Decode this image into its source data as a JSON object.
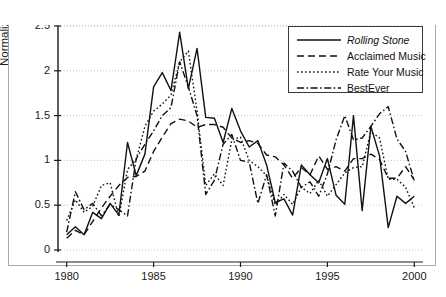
{
  "figure": {
    "background": "#ffffff",
    "border_color": "#aaaaaa",
    "axis_color": "#1a1a1a",
    "grid_color": "#bbbbbb"
  },
  "axes": {
    "ylabel": "Normalized index",
    "yticks": [
      "0",
      "0.5",
      "1",
      "1.5",
      "2",
      "2.5"
    ],
    "xticks": [
      "1980",
      "1985",
      "1990",
      "1995",
      "2000"
    ]
  },
  "legend": {
    "items": [
      {
        "label": "Rolling Stone",
        "style": "solid",
        "italic": true
      },
      {
        "label": "Acclaimed Music",
        "style": "dashed",
        "italic": false
      },
      {
        "label": "Rate Your Music",
        "style": "dotted",
        "italic": false
      },
      {
        "label": "BestEver",
        "style": "dashdot",
        "italic": false
      }
    ]
  },
  "chart_data": {
    "type": "line",
    "title": "",
    "xlabel": "",
    "ylabel": "Normalized index",
    "xlim": [
      1979.5,
      2000.5
    ],
    "ylim": [
      0,
      2.5
    ],
    "xticks": [
      1980,
      1985,
      1990,
      1995,
      2000
    ],
    "yticks": [
      0,
      0.5,
      1,
      1.5,
      2,
      2.5
    ],
    "grid": "horizontal-dotted",
    "legend_position": "top-right",
    "x": [
      1980,
      1980.5,
      1981,
      1981.5,
      1982,
      1982.5,
      1983,
      1983.5,
      1984,
      1984.5,
      1985,
      1985.5,
      1986,
      1986.5,
      1987,
      1987.5,
      1988,
      1988.5,
      1989,
      1989.5,
      1990,
      1990.5,
      1991,
      1991.5,
      1992,
      1992.5,
      1993,
      1993.5,
      1994,
      1994.5,
      1995,
      1995.5,
      1996,
      1996.5,
      1997,
      1997.5,
      1998,
      1998.5,
      1999,
      1999.5,
      2000
    ],
    "series": [
      {
        "name": "Rolling Stone",
        "style": "solid",
        "values": [
          0.17,
          0.26,
          0.17,
          0.42,
          0.35,
          0.52,
          0.39,
          1.2,
          0.83,
          1.07,
          1.82,
          1.98,
          1.78,
          2.43,
          1.8,
          2.25,
          1.48,
          1.47,
          1.2,
          1.58,
          1.33,
          1.15,
          1.22,
          0.95,
          0.53,
          0.57,
          0.39,
          0.95,
          0.84,
          0.75,
          1.02,
          0.61,
          0.51,
          1.5,
          0.44,
          1.38,
          1.05,
          0.25,
          0.6,
          0.52,
          0.6
        ]
      },
      {
        "name": "Acclaimed Music",
        "style": "dashed",
        "values": [
          0.13,
          0.22,
          0.17,
          0.32,
          0.47,
          0.6,
          0.72,
          0.81,
          0.82,
          0.88,
          1.1,
          1.26,
          1.41,
          1.46,
          1.44,
          1.37,
          1.4,
          1.4,
          1.37,
          1.25,
          1.2,
          1.22,
          1.19,
          1.06,
          1.04,
          0.95,
          0.8,
          0.92,
          0.84,
          1.05,
          0.9,
          0.93,
          0.88,
          1.02,
          1.02,
          1.07,
          1.01,
          0.8,
          0.8,
          0.93,
          0.78
        ]
      },
      {
        "name": "Rate Your Music",
        "style": "dotted",
        "values": [
          0.33,
          0.56,
          0.42,
          0.49,
          0.72,
          0.75,
          0.37,
          0.9,
          1.01,
          1.38,
          1.55,
          1.63,
          1.73,
          2.1,
          2.22,
          1.55,
          0.72,
          0.85,
          0.72,
          1.23,
          1.26,
          1.0,
          0.93,
          0.83,
          0.5,
          0.62,
          0.51,
          0.7,
          0.63,
          0.78,
          0.6,
          0.73,
          0.86,
          0.92,
          0.93,
          1.32,
          1.25,
          0.79,
          0.79,
          0.7,
          0.47
        ]
      },
      {
        "name": "BestEver",
        "style": "dashdot",
        "values": [
          0.2,
          0.65,
          0.45,
          0.52,
          0.38,
          0.51,
          0.45,
          0.38,
          1.02,
          1.18,
          1.33,
          1.5,
          1.59,
          2.1,
          1.82,
          1.5,
          0.62,
          0.78,
          1.18,
          1.29,
          1.0,
          0.98,
          0.52,
          0.84,
          0.38,
          0.97,
          0.88,
          0.7,
          0.76,
          0.6,
          0.85,
          1.23,
          1.5,
          1.23,
          1.25,
          1.38,
          1.52,
          1.6,
          1.24,
          1.1,
          0.77
        ]
      }
    ]
  }
}
